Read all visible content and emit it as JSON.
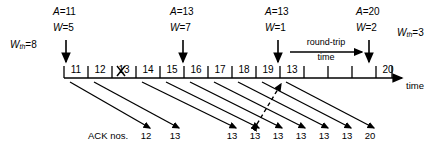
{
  "figure": {
    "time_axis_label": "time",
    "ack_row_label": "ACK nos.",
    "rtt_label_line1": "round-trip",
    "rtt_label_line2": "time",
    "lost_segment_marker": "X",
    "line_color": "#000000"
  },
  "window_events": [
    {
      "id": "evt-0",
      "wth_label": "W",
      "wth_sub": "th",
      "wth_value": "=8",
      "x": 10,
      "y": 36
    },
    {
      "id": "evt-1",
      "ack_label": "A",
      "ack_value": "=11",
      "w_label": "W",
      "w_value": "=5",
      "x": 53,
      "y": 6
    },
    {
      "id": "evt-2",
      "ack_label": "A",
      "ack_value": "=13",
      "w_label": "W",
      "w_value": "=7",
      "x": 170,
      "y": 6
    },
    {
      "id": "evt-3",
      "ack_label": "A",
      "ack_value": "=13",
      "w_label": "W",
      "w_value": "=1",
      "x": 265,
      "y": 6
    },
    {
      "id": "evt-4",
      "ack_label": "A",
      "ack_value": "=20",
      "w_label": "W",
      "w_value": "=2",
      "x": 356,
      "y": 6
    },
    {
      "id": "evt-5",
      "wth_label": "W",
      "wth_sub": "th",
      "wth_value": "=3",
      "x": 399,
      "y": 30
    }
  ],
  "timeline": {
    "x_start": 64,
    "x_end": 400,
    "y": 78,
    "tick_count": 14,
    "tick_spacing": 24,
    "slots": [
      {
        "index": 0,
        "seq": "11"
      },
      {
        "index": 1,
        "seq": "12"
      },
      {
        "index": 2,
        "seq": "13",
        "lost": true
      },
      {
        "index": 3,
        "seq": "14"
      },
      {
        "index": 4,
        "seq": "15"
      },
      {
        "index": 5,
        "seq": "16"
      },
      {
        "index": 6,
        "seq": "17"
      },
      {
        "index": 7,
        "seq": "18"
      },
      {
        "index": 8,
        "seq": "19"
      },
      {
        "index": 9,
        "seq": "13"
      },
      {
        "index": 10,
        "seq": ""
      },
      {
        "index": 11,
        "seq": ""
      },
      {
        "index": 12,
        "seq": ""
      },
      {
        "index": 13,
        "seq": "20"
      }
    ]
  },
  "ack_numbers": [
    {
      "index": 0,
      "value": "12",
      "x": 145
    },
    {
      "index": 1,
      "value": "13",
      "x": 174
    },
    {
      "index": 2,
      "value": "13",
      "x": 231
    },
    {
      "index": 3,
      "value": "13",
      "x": 254
    },
    {
      "index": 4,
      "value": "13",
      "x": 277
    },
    {
      "index": 5,
      "value": "13",
      "x": 300
    },
    {
      "index": 6,
      "value": "13",
      "x": 323
    },
    {
      "index": 7,
      "value": "13",
      "x": 346
    },
    {
      "index": 8,
      "value": "20",
      "x": 369
    }
  ]
}
